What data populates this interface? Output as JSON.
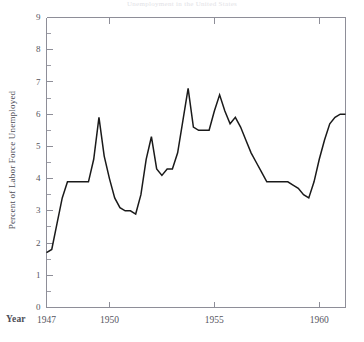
{
  "chart_data": {
    "type": "line",
    "title": "Unemployment in the United States",
    "xlabel": "Year",
    "ylabel": "Percent of Labor Force Unemployed",
    "xlim": [
      1947,
      1961.25
    ],
    "ylim": [
      0,
      9
    ],
    "ytick_labels": [
      "0",
      "1",
      "2",
      "3",
      "4",
      "5",
      "6",
      "7",
      "8",
      "9"
    ],
    "ytick_values": [
      0,
      1,
      2,
      3,
      4,
      5,
      6,
      7,
      8,
      9
    ],
    "yminor_step": 0.5,
    "xtick_labels": [
      "1947",
      "1950",
      "1955",
      "1960"
    ],
    "xtick_values": [
      1947,
      1950,
      1955,
      1960
    ],
    "grid": false,
    "legend": "none",
    "series": [
      {
        "name": "Percent of Labor Force Unemployed",
        "color": "#1a1a1a",
        "x": [
          1947.0,
          1947.25,
          1947.5,
          1947.75,
          1948.0,
          1948.25,
          1948.5,
          1948.75,
          1949.0,
          1949.25,
          1949.5,
          1949.75,
          1950.0,
          1950.25,
          1950.5,
          1950.75,
          1951.0,
          1951.25,
          1951.5,
          1951.75,
          1952.0,
          1952.25,
          1952.5,
          1952.75,
          1953.0,
          1953.25,
          1953.5,
          1953.75,
          1954.0,
          1954.25,
          1954.5,
          1954.75,
          1955.0,
          1955.25,
          1955.5,
          1955.75,
          1956.0,
          1956.25,
          1956.5,
          1956.75,
          1957.0,
          1957.25,
          1957.5,
          1957.75,
          1958.0,
          1958.25,
          1958.5,
          1958.75,
          1959.0,
          1959.25,
          1959.5,
          1959.75,
          1960.0,
          1960.25,
          1960.5,
          1960.75,
          1961.0,
          1961.25
        ],
        "y": [
          1.7,
          1.8,
          2.6,
          3.4,
          3.9,
          3.9,
          3.9,
          3.9,
          3.9,
          4.6,
          5.9,
          4.7,
          4.0,
          3.4,
          3.1,
          3.0,
          3.0,
          2.9,
          3.5,
          4.6,
          5.3,
          4.3,
          4.1,
          4.3,
          4.3,
          4.8,
          5.8,
          6.8,
          5.6,
          5.5,
          5.5,
          5.5,
          6.1,
          6.6,
          6.1,
          5.7,
          5.9,
          5.6,
          5.2,
          4.8,
          4.5,
          4.2,
          3.9,
          3.9,
          3.9,
          3.9,
          3.9,
          3.8,
          3.7,
          3.5,
          3.4,
          3.9,
          4.6,
          5.2,
          5.7,
          5.9,
          6.0,
          6.0
        ]
      }
    ]
  },
  "figure": {
    "title": "Unemployment in the United States",
    "year_label": "Year"
  }
}
